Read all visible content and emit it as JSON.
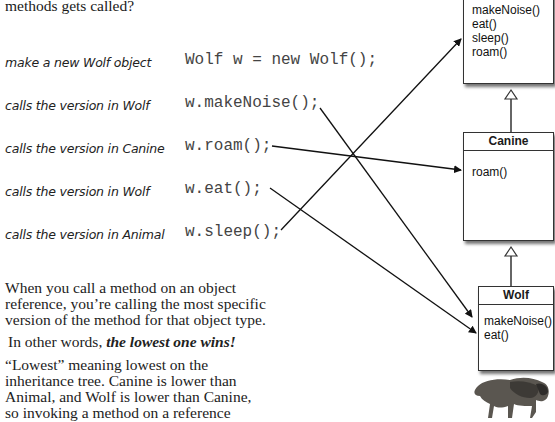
{
  "intro": {
    "top_line": "methods gets called?"
  },
  "rows": [
    {
      "annotation": "make a new Wolf object",
      "code": "Wolf w = new Wolf();"
    },
    {
      "annotation": "calls the version in Wolf",
      "code": "w.makeNoise();"
    },
    {
      "annotation": "calls the version in Canine",
      "code": "w.roam();"
    },
    {
      "annotation": "calls the version in Wolf",
      "code": "w.eat();"
    },
    {
      "annotation": "calls the version in Animal",
      "code": "w.sleep();"
    }
  ],
  "explanation": {
    "p1_lines": [
      "When you call a method on an object",
      "reference, you’re calling the most specific",
      "version of the method for that object type."
    ],
    "p2_prefix": "In other words, ",
    "p2_emphasis": "the lowest one wins!",
    "p3_lines": [
      "“Lowest” meaning lowest on the",
      "inheritance tree. Canine is lower than",
      "Animal, and Wolf is lower than Canine,",
      "so invoking a method on a reference"
    ]
  },
  "diagram": {
    "animal": {
      "title": "",
      "methods": [
        "makeNoise()",
        "eat()",
        "sleep()",
        "roam()"
      ]
    },
    "canine": {
      "title": "Canine",
      "methods": [
        "roam()"
      ]
    },
    "wolf": {
      "title": "Wolf",
      "methods": [
        "makeNoise()",
        "eat()"
      ]
    },
    "image": "wolf-photo"
  }
}
